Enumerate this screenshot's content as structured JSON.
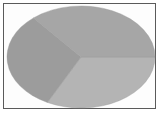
{
  "chart_data": {
    "type": "pie",
    "title": "",
    "categories": [
      "Slice A",
      "Slice B",
      "Slice C"
    ],
    "values": [
      32.5,
      31.4,
      36.1
    ],
    "colors": [
      "#b4b4b4",
      "#9c9c9c",
      "#a6a6a6"
    ],
    "start_angle_deg": 0,
    "direction": "clockwise",
    "legend": "none",
    "labels_visible": false,
    "shape": "ellipse (3D-tilted appearance)"
  },
  "layout": {
    "frame_border_color": "#5a5a5a",
    "background": "#ffffff",
    "center": [
      81,
      57
    ],
    "rx": 74,
    "ry": 51
  }
}
